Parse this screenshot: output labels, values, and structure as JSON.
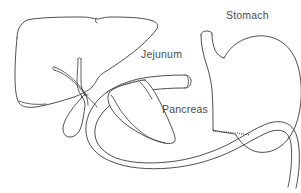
{
  "figure": {
    "type": "anatomical-line-drawing",
    "background_color": "#ffffff",
    "line_color": "#3a3a3a",
    "label_color": "#4a4a4a"
  },
  "labels": {
    "jejunum": "Jejunum",
    "pancreas": "Pancreas",
    "stomach": "Stomach"
  },
  "structures": {
    "liver": "liver",
    "gallbladder": "gallbladder",
    "bile_duct": "bile-duct-tree",
    "duodenum": "duodenum-c-loop",
    "jejunum_limb": "jejunum-limb",
    "pancreas_body": "pancreas-body",
    "stomach_body": "stomach-body",
    "esophagus": "esophagus-stub"
  }
}
